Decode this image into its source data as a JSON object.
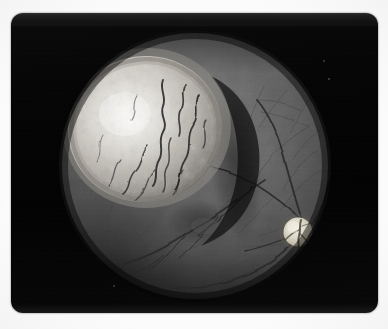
{
  "image": {
    "kind": "fundus-photograph",
    "subject": "retina with elevated choroidal tumor mass",
    "modality": "color fundus photography (monochrome print)",
    "width_px": 388,
    "height_px": 329,
    "caption": ""
  },
  "canvas": {
    "background_color": "#fdfdfd"
  },
  "photo_frame": {
    "x": 11,
    "y": 13,
    "width": 367,
    "height": 300,
    "corner_radius": 12,
    "color": "#050505",
    "label": "photographic print border"
  },
  "fundus_field": {
    "center_x": 194,
    "center_y": 165,
    "radius": 136,
    "base_color": "#6b6b6b",
    "rim_color": "#2a2a2a",
    "label": "circular fundus field of view"
  },
  "features": [
    {
      "name": "tumor-mass",
      "label": "Elevated dome-shaped tumor mass",
      "center_x": 138,
      "center_y": 133,
      "radius_x": 78,
      "radius_y": 74,
      "highlight_color": "#e8e6e0",
      "body_color": "#bdbab3",
      "description": "bright mottled nodular lesion with serpiginous dark surface vessels"
    },
    {
      "name": "tumor-shadow",
      "label": "Shadow crescent along the temporal tumor margin",
      "color": "#1d1d1d"
    },
    {
      "name": "optic-disc",
      "label": "Optic disc",
      "center_x": 297,
      "center_y": 232,
      "radius": 14,
      "color": "#d9d4c6",
      "description": "bright round disc with central vessel trunk"
    },
    {
      "name": "macula",
      "label": "Macular region",
      "center_x": 237,
      "center_y": 225,
      "color": "#4d4d4d",
      "description": "diffuse darker zone temporal-inferior to tumor"
    },
    {
      "name": "retinal-vessels",
      "label": "Retinal blood vessels",
      "color": "#2e2e2e",
      "description": "branching arcades radiating from the optic disc across the fundus"
    },
    {
      "name": "annotation-mark",
      "label": "Faint handwritten mark on the lower fundus",
      "center_x": 232,
      "center_y": 294,
      "text": ""
    }
  ],
  "colors": {
    "paper": "#fdfdfd",
    "print_black": "#050505",
    "retina_mid_gray": "#6b6b6b",
    "retina_dark_gray": "#3a3a3a",
    "tumor_highlight": "#eceae5",
    "tumor_mid": "#c4c1b9",
    "vessel_dark": "#262626",
    "disc_white": "#ddd8cb"
  }
}
